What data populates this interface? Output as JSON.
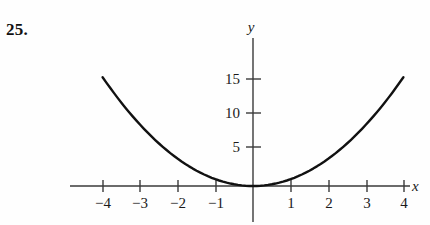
{
  "problem": {
    "number": "25."
  },
  "chart_data": {
    "type": "line",
    "title": "",
    "xlabel": "x",
    "ylabel": "y",
    "function": "y = x^2",
    "xlim": [
      -4.2,
      4.3
    ],
    "ylim": [
      -1.5,
      20.5
    ],
    "grid": false,
    "legend": false,
    "x_ticks": [
      -4,
      -3,
      -2,
      -1,
      1,
      2,
      3,
      4
    ],
    "x_tick_labels": [
      "−4",
      "−3",
      "−2",
      "−1",
      "1",
      "2",
      "3",
      "4"
    ],
    "y_ticks": [
      5,
      10,
      15
    ],
    "y_tick_labels": [
      "5",
      "10",
      "15"
    ],
    "x": [
      -4,
      -3.5,
      -3,
      -2.5,
      -2,
      -1.5,
      -1,
      -0.5,
      0,
      0.5,
      1,
      1.5,
      2,
      2.5,
      3,
      3.5,
      4
    ],
    "y": [
      16,
      12.25,
      9,
      6.25,
      4,
      2.25,
      1,
      0.25,
      0,
      0.25,
      1,
      2.25,
      4,
      6.25,
      9,
      12.25,
      16
    ],
    "curve_color": "#111111",
    "axis_color": "#3a3a3a",
    "background_color": "#fefefe"
  }
}
